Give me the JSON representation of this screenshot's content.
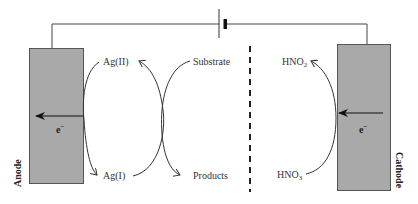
{
  "diagram": {
    "type": "electrochemical-cell-schematic",
    "colors": {
      "electrode_fill": "#a9a9a9",
      "electrode_stroke": "#555555",
      "line": "#333333",
      "background": "#ffffff"
    },
    "anode": {
      "label": "Anode",
      "electron_label": "e",
      "electron_sup": "−",
      "arrow_direction": "left"
    },
    "cathode": {
      "label": "Cathode",
      "electron_label": "e",
      "electron_sup": "−",
      "arrow_direction": "left"
    },
    "anode_side_species": {
      "top": "Ag(II)",
      "bottom": "Ag(I)"
    },
    "mediator_reaction": {
      "reactant": "Substrate",
      "product": "Products"
    },
    "cathode_side_species": {
      "top_base": "HNO",
      "top_sub": "2",
      "bottom_base": "HNO",
      "bottom_sub": "3"
    },
    "power_source": "battery",
    "separator": "dashed-membrane"
  }
}
